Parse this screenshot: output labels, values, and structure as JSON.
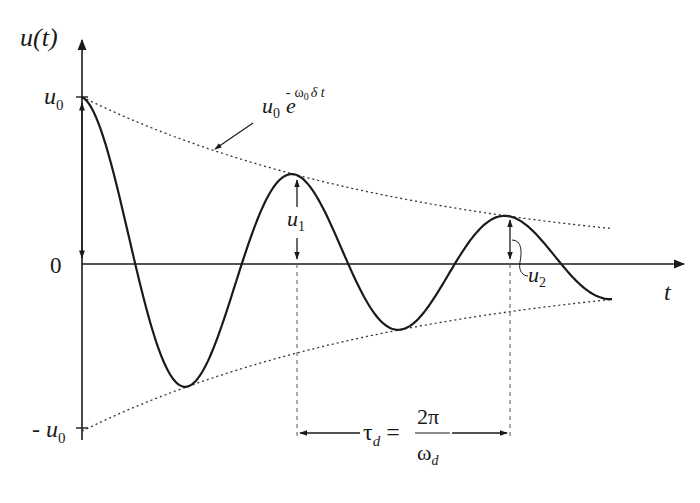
{
  "diagram": {
    "y_axis_label": "u(t)",
    "x_axis_label": "t",
    "ticks": {
      "u0": {
        "main": "u",
        "sub": "0"
      },
      "zero": "0",
      "neg_u0": {
        "prefix": "- ",
        "main": "u",
        "sub": "0"
      }
    },
    "envelope_label": {
      "base": "u",
      "base_sub": "0",
      "exp_base": "e",
      "exp_sign": "-",
      "exp_omega": "ω",
      "exp_omega_sub": "0",
      "exp_rest": "δ t"
    },
    "amplitude_labels": {
      "u1": {
        "main": "u",
        "sub": "1"
      },
      "u2": {
        "main": "u",
        "sub": "2"
      }
    },
    "period_label": {
      "tau": "τ",
      "tau_sub": "d",
      "equals": "=",
      "numerator": "2π",
      "denominator": "ω",
      "denominator_sub": "d"
    },
    "colors": {
      "line": "#1a1a1a",
      "envelope": "#333333",
      "background": "#ffffff"
    }
  },
  "chart_data": {
    "type": "line",
    "xlabel": "t",
    "ylabel": "u(t)",
    "model": "u(t) = u0 · e^(-ω0 δ t) · cos(ωd t)",
    "params_normalized": {
      "u0": 1.0,
      "decay_per_period": 0.535,
      "period_tau_d": 1.0
    },
    "series": [
      {
        "name": "u(t)",
        "points_t_over_tau": [
          0,
          0.25,
          0.5,
          0.75,
          1.0,
          1.25,
          1.5,
          1.75,
          2.0,
          2.5
        ],
        "values_over_u0": [
          1.0,
          0.0,
          -0.73,
          0.0,
          0.535,
          0.0,
          -0.39,
          0.0,
          0.29,
          -0.21
        ]
      },
      {
        "name": "upper envelope u0 e^(-ω0 δ t)",
        "points_t_over_tau": [
          0,
          1,
          2,
          2.5
        ],
        "values_over_u0": [
          1.0,
          0.535,
          0.29,
          0.21
        ]
      },
      {
        "name": "lower envelope -u0 e^(-ω0 δ t)",
        "points_t_over_tau": [
          0,
          1,
          2,
          2.5
        ],
        "values_over_u0": [
          -1.0,
          -0.535,
          -0.29,
          -0.21
        ]
      }
    ],
    "annotations": [
      "u0",
      "-u0",
      "0",
      "u1 (amplitude at first peak)",
      "u2 (amplitude at second peak)",
      "τd = 2π/ωd (damped period)"
    ],
    "grid": false,
    "legend": "none"
  }
}
